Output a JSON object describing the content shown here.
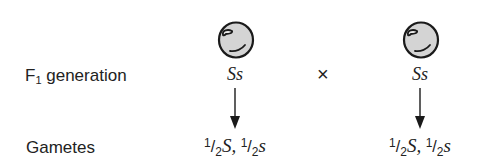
{
  "diagram": {
    "type": "genetic-cross",
    "rows": {
      "f1": {
        "label_main": "F",
        "label_sub": "1",
        "label_rest": " generation"
      },
      "gametes": {
        "label": "Gametes"
      }
    },
    "parents": [
      {
        "icon": "round-pea-icon",
        "genotype": "Ss",
        "gametes": [
          {
            "num": "1",
            "den": "2",
            "allele": "S",
            "sep": ","
          },
          {
            "num": "1",
            "den": "2",
            "allele": "s",
            "sep": ""
          }
        ]
      },
      {
        "icon": "round-pea-icon",
        "genotype": "Ss",
        "gametes": [
          {
            "num": "1",
            "den": "2",
            "allele": "S",
            "sep": ","
          },
          {
            "num": "1",
            "den": "2",
            "allele": "s",
            "sep": ""
          }
        ]
      }
    ],
    "cross_symbol": "×",
    "colors": {
      "pea_fill": "#d4d4d4",
      "ink": "#1a1a1a",
      "background": "#ffffff"
    }
  }
}
